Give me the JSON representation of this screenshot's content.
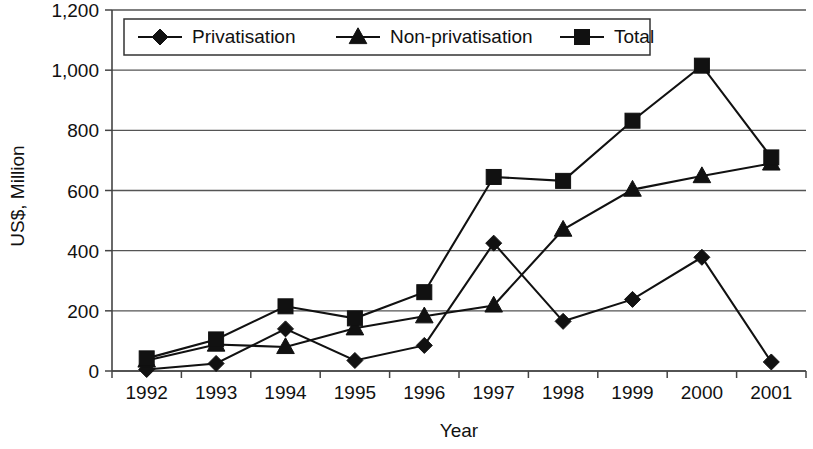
{
  "chart_data": {
    "type": "line",
    "title": "",
    "xlabel": "Year",
    "ylabel": "US$, Million",
    "categories": [
      "1992",
      "1993",
      "1994",
      "1995",
      "1996",
      "1997",
      "1998",
      "1999",
      "2000",
      "2001"
    ],
    "ylim": [
      0,
      1200
    ],
    "ytick_labels": [
      "0",
      "200",
      "400",
      "600",
      "800",
      "1,000",
      "1,200"
    ],
    "ytick_values": [
      0,
      200,
      400,
      600,
      800,
      1000,
      1200
    ],
    "grid": true,
    "legend_position": "top-center-inside",
    "series": [
      {
        "name": "Privatisation",
        "marker": "diamond",
        "values": [
          5,
          25,
          140,
          35,
          85,
          425,
          165,
          238,
          378,
          30
        ]
      },
      {
        "name": "Non-privatisation",
        "marker": "triangle",
        "values": [
          35,
          88,
          80,
          142,
          182,
          218,
          470,
          603,
          648,
          690
        ]
      },
      {
        "name": "Total",
        "marker": "square",
        "values": [
          42,
          105,
          215,
          175,
          262,
          645,
          632,
          832,
          1015,
          710
        ]
      }
    ]
  },
  "legend": {
    "items": [
      {
        "label": "Privatisation",
        "marker": "diamond-marker"
      },
      {
        "label": "Non-privatisation",
        "marker": "triangle-marker"
      },
      {
        "label": "Total",
        "marker": "square-marker"
      }
    ]
  },
  "axes": {
    "y_title": "US$, Million",
    "x_title": "Year"
  }
}
